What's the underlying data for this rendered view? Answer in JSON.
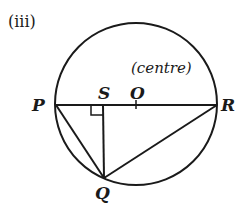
{
  "figure": {
    "part_label": "(iii)",
    "centre_note": "(centre)",
    "points": {
      "P": {
        "label": "P",
        "x": 56,
        "y": 105
      },
      "R": {
        "label": "R",
        "x": 217,
        "y": 105
      },
      "O": {
        "label": "O",
        "x": 136,
        "y": 105
      },
      "S": {
        "label": "S",
        "x": 103,
        "y": 105
      },
      "Q": {
        "label": "Q",
        "x": 104,
        "y": 178
      }
    },
    "circle": {
      "cx": 136,
      "cy": 104,
      "r": 81
    },
    "segments": [
      "PR",
      "PQ",
      "SQ",
      "QR"
    ],
    "right_angle_at": "S",
    "stroke_color": "#1a1a1a"
  }
}
